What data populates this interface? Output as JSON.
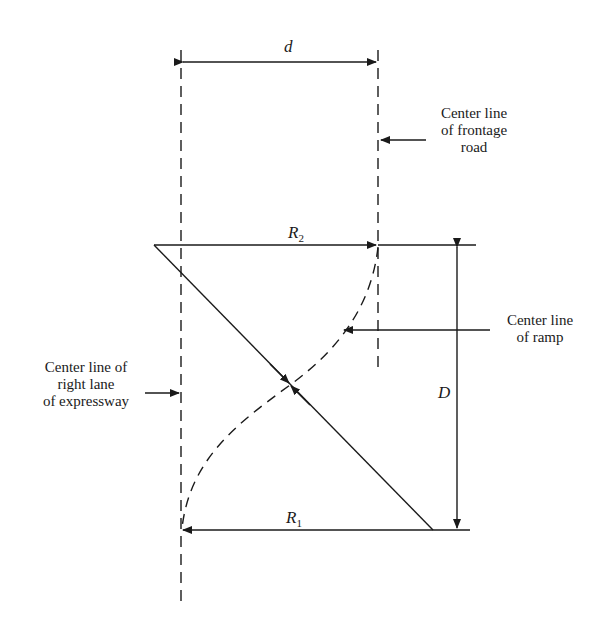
{
  "diagram": {
    "type": "highway ramp geometry (reverse curve)",
    "colors": {
      "ink": "#1a1a1a",
      "background": "#ffffff"
    },
    "dimensions": {
      "d": {
        "label": "d",
        "meaning": "offset between expressway right lane and frontage road center lines"
      },
      "D": {
        "label": "D",
        "meaning": "longitudinal length of ramp"
      },
      "R1": {
        "label": "R",
        "subscript": "1"
      },
      "R2": {
        "label": "R",
        "subscript": "2"
      }
    },
    "callouts": {
      "frontage": [
        "Center line",
        "of frontage",
        "road"
      ],
      "ramp": [
        "Center line",
        "of ramp"
      ],
      "expressway": [
        "Center line of",
        "right lane",
        "of expressway"
      ]
    }
  }
}
